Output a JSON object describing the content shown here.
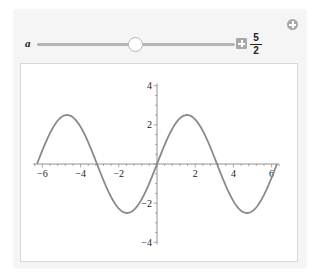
{
  "manipulate": {
    "variable_label": "a",
    "slider": {
      "min": -5,
      "max": 10,
      "value": 2.5,
      "value_display": {
        "numerator": "5",
        "denominator": "2"
      }
    },
    "icons": {
      "increment": "plus-square-icon",
      "add_panel": "add-circle-icon"
    }
  },
  "colors": {
    "panel_bg": "#f5f5f5",
    "curve": "#8a8a8a",
    "axis": "#777777",
    "button": "#a8a8a8"
  },
  "chart_data": {
    "type": "line",
    "title": "",
    "function": "a*sin(x), a = 5/2",
    "xlabel": "",
    "ylabel": "",
    "xlim": [
      -6.28,
      6.28
    ],
    "ylim": [
      -4,
      4
    ],
    "x_ticks": [
      -6,
      -4,
      -2,
      2,
      4,
      6
    ],
    "y_ticks": [
      -4,
      -2,
      2,
      4
    ],
    "x_tick_labels": [
      "-6",
      "-4",
      "-2",
      "2",
      "4",
      "6"
    ],
    "y_tick_labels": [
      "-4",
      "-2",
      "2",
      "4"
    ],
    "grid": false,
    "series": [
      {
        "name": "2.5 sin(x)",
        "x": [
          -6.28,
          -4.71,
          -3.14,
          -1.57,
          0,
          1.57,
          3.14,
          4.71,
          6.28
        ],
        "values": [
          0,
          2.5,
          0,
          -2.5,
          0,
          2.5,
          0,
          -2.5,
          0
        ]
      }
    ]
  }
}
